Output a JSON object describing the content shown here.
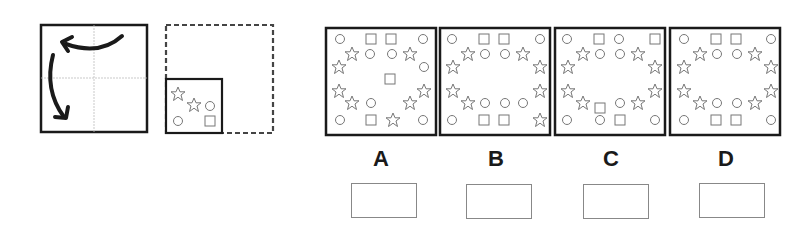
{
  "puzzle": {
    "instruction_figure": {
      "fold_square": {
        "quadrant_lines": true,
        "arrows": [
          "curved-arrow-top-to-left",
          "curved-arrow-left-to-bottom"
        ]
      },
      "unfolded_square": {
        "style": "dashed",
        "folded_piece": {
          "position": "bottom-left quadrant",
          "shapes": [
            "star",
            "star",
            "circle",
            "circle",
            "square"
          ]
        }
      }
    },
    "options": [
      {
        "label": "A",
        "shapes_summary": "stars around border, center square"
      },
      {
        "label": "B",
        "shapes_summary": "stars around border, circles inner ring"
      },
      {
        "label": "C",
        "shapes_summary": "stars around border, mixed squares/circles"
      },
      {
        "label": "D",
        "shapes_summary": "stars around border, symmetric"
      }
    ],
    "answer_boxes": [
      "",
      "",
      "",
      ""
    ]
  },
  "colors": {
    "line": "#1a1a1a",
    "shape": "#777777",
    "guide": "#bbbbbb",
    "box": "#888888"
  }
}
